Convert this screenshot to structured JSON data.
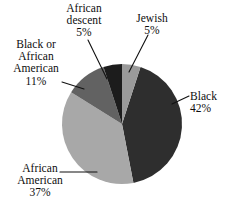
{
  "chart_data": {
    "type": "pie",
    "title": "",
    "subtitle": "",
    "xlabel": "",
    "ylabel": "",
    "legend_position": "none",
    "grid": false,
    "units": "percent",
    "start_angle_deg": 0,
    "direction": "clockwise",
    "categories": [
      "Jewish",
      "Black",
      "African American",
      "Black or African American",
      "African descent"
    ],
    "values": [
      5,
      42,
      37,
      11,
      5
    ],
    "slices": [
      {
        "id": "jewish",
        "label": "Jewish",
        "value": 5,
        "value_text": "5%",
        "color": "#9a9a9a",
        "start_deg": 0,
        "end_deg": 18,
        "label_lines": [
          "Jewish",
          "5%"
        ],
        "label_align": "center",
        "leader_line": true
      },
      {
        "id": "black",
        "label": "Black",
        "value": 42,
        "value_text": "42%",
        "color": "#2e2e2e",
        "start_deg": 18,
        "end_deg": 169,
        "label_lines": [
          "Black",
          "42%"
        ],
        "label_align": "left",
        "leader_line": true
      },
      {
        "id": "african-american",
        "label": "African American",
        "value": 37,
        "value_text": "37%",
        "color": "#a8a8a8",
        "start_deg": 169,
        "end_deg": 302,
        "label_lines": [
          "African",
          "American",
          "37%"
        ],
        "label_align": "center",
        "leader_line": true
      },
      {
        "id": "black-or-african-american",
        "label": "Black or African American",
        "value": 11,
        "value_text": "11%",
        "color": "#626262",
        "start_deg": 302,
        "end_deg": 342,
        "label_lines": [
          "Black or",
          "African",
          "American",
          "11%"
        ],
        "label_align": "center",
        "leader_line": true
      },
      {
        "id": "african-descent",
        "label": "African descent",
        "value": 5,
        "value_text": "5%",
        "color": "#1c1c1c",
        "start_deg": 342,
        "end_deg": 360,
        "label_lines": [
          "African",
          "descent",
          "5%"
        ],
        "label_align": "center",
        "leader_line": true
      }
    ]
  },
  "labels": {
    "african_descent": {
      "line1": "African",
      "line2": "descent",
      "line3": "5%"
    },
    "jewish": {
      "line1": "Jewish",
      "line2": "5%"
    },
    "black_or_african_american": {
      "line1": "Black or",
      "line2": "African",
      "line3": "American",
      "line4": "11%"
    },
    "black": {
      "line1": "Black",
      "line2": "42%"
    },
    "african_american": {
      "line1": "African",
      "line2": "American",
      "line3": "37%"
    }
  },
  "colors": {
    "background": "#ffffff",
    "text": "#0d0d0d",
    "leader_line": "#111111",
    "slice_black": "#2e2e2e",
    "slice_african_american": "#a8a8a8",
    "slice_black_or_african_american": "#626262",
    "slice_african_descent": "#1c1c1c",
    "slice_jewish": "#9a9a9a"
  }
}
